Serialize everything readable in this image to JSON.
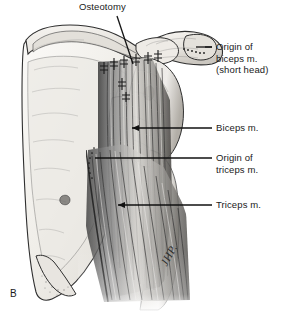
{
  "figure": {
    "letter": "B",
    "signature": "JHP.",
    "background_color": "#ffffff",
    "ink_color": "#1a1a1a",
    "bone_fill": "#f2f0ec",
    "muscle_shadow": "#4a4a4a"
  },
  "labels": {
    "osteotomy": "Osteotomy",
    "biceps_origin_line1": "Origin of",
    "biceps_origin_line2": "biceps m.",
    "biceps_origin_line3": "(short head)",
    "biceps": "Biceps m.",
    "triceps_origin_line1": "Origin of",
    "triceps_origin_line2": "triceps m.",
    "triceps": "Triceps m."
  },
  "anatomy": {
    "structures": [
      "scapula",
      "scapular spine",
      "supraspinous fossa",
      "infraspinous fossa",
      "acromion",
      "coracoid process",
      "glenoid",
      "humeral head",
      "humerus shaft",
      "inferior angle",
      "biceps muscle",
      "triceps muscle",
      "coracoid osteotomy site",
      "sutures"
    ]
  }
}
